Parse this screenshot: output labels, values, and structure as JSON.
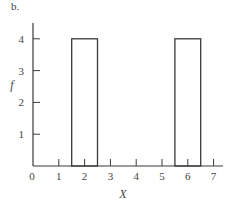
{
  "panel_label": "b.",
  "chart_data": {
    "type": "bar",
    "title": "",
    "xlabel": "X",
    "ylabel": "f",
    "xlim": [
      0,
      7
    ],
    "ylim": [
      0,
      4.5
    ],
    "x_ticks": [
      0,
      1,
      2,
      3,
      4,
      5,
      6,
      7
    ],
    "y_ticks": [
      1,
      2,
      3,
      4
    ],
    "grid": false,
    "legend": null,
    "bars": [
      {
        "x_center": 2,
        "x_start": 1.5,
        "x_end": 2.5,
        "value": 4
      },
      {
        "x_center": 6,
        "x_start": 5.5,
        "x_end": 6.5,
        "value": 4
      }
    ],
    "categories": [
      "2",
      "6"
    ],
    "values": [
      4,
      4
    ]
  },
  "style": {
    "line_color": "#3a3a3a",
    "background": "#ffffff"
  }
}
